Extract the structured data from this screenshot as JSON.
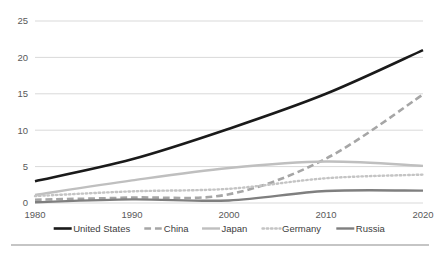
{
  "chart_data": {
    "type": "line",
    "title": "",
    "xlabel": "",
    "ylabel": "",
    "x": [
      1980,
      1990,
      2000,
      2010,
      2020
    ],
    "categories": [
      "1980",
      "1990",
      "2000",
      "2010",
      "2020"
    ],
    "xlim": [
      1980,
      2020
    ],
    "ylim": [
      0,
      25
    ],
    "yticks": [
      0,
      5,
      10,
      15,
      20,
      25
    ],
    "ytick_labels": [
      "0",
      "5",
      "10",
      "15",
      "20",
      "25"
    ],
    "xtick_labels": [
      "1980",
      "1990",
      "2000",
      "2010",
      "2020"
    ],
    "grid": true,
    "legend_position": "bottom",
    "series": [
      {
        "name": "United States",
        "values": [
          3.0,
          6.0,
          10.2,
          15.0,
          21.0
        ],
        "color": "#1a1a1a",
        "style": "solid",
        "width": 2.6
      },
      {
        "name": "China",
        "values": [
          0.45,
          0.75,
          1.2,
          6.1,
          14.9
        ],
        "color": "#a6a6a6",
        "style": "dashed",
        "width": 2.6
      },
      {
        "name": "Japan",
        "values": [
          1.1,
          3.1,
          4.8,
          5.7,
          5.1
        ],
        "color": "#bfbfbf",
        "style": "solid",
        "width": 2.4
      },
      {
        "name": "Germany",
        "values": [
          0.95,
          1.6,
          1.95,
          3.4,
          3.9
        ],
        "color": "#c4c4c4",
        "style": "dotted",
        "width": 2.4
      },
      {
        "name": "Russia",
        "values": [
          0.1,
          0.5,
          0.35,
          1.65,
          1.7
        ],
        "color": "#7f7f7f",
        "style": "solid",
        "width": 2.4
      }
    ]
  },
  "legend": {
    "items": [
      {
        "label": "United States"
      },
      {
        "label": "China"
      },
      {
        "label": "Japan"
      },
      {
        "label": "Germany"
      },
      {
        "label": "Russia"
      }
    ]
  },
  "colors": {
    "grid": "#d9d9d9",
    "tick_text": "#595959",
    "legend_text": "#404040",
    "rule": "#8c8c8c",
    "background": "#ffffff"
  }
}
